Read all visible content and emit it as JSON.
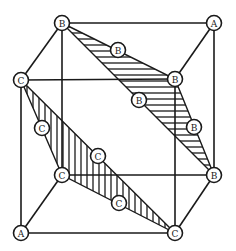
{
  "diagram": {
    "type": "crystal-lattice-cube",
    "colors": {
      "stroke": "#1a1a1a",
      "fill": "#ffffff"
    },
    "cube_vertices": [
      {
        "id": "v_top_back_left",
        "label": "B",
        "x": 62,
        "y": 23
      },
      {
        "id": "v_top_back_right",
        "label": "A",
        "x": 214,
        "y": 23
      },
      {
        "id": "v_top_front_left",
        "label": "C",
        "x": 21,
        "y": 80
      },
      {
        "id": "v_top_front_right",
        "label": "B",
        "x": 175,
        "y": 79
      },
      {
        "id": "v_bot_back_left",
        "label": "C",
        "x": 62,
        "y": 175
      },
      {
        "id": "v_bot_back_right",
        "label": "B",
        "x": 214,
        "y": 175
      },
      {
        "id": "v_bot_front_left",
        "label": "A",
        "x": 21,
        "y": 233
      },
      {
        "id": "v_bot_front_right",
        "label": "C",
        "x": 175,
        "y": 233
      }
    ],
    "edge_midpoints": [
      {
        "id": "m_b_upper",
        "label": "B",
        "x": 118,
        "y": 50
      },
      {
        "id": "m_b_diag",
        "label": "B",
        "x": 139,
        "y": 100
      },
      {
        "id": "m_b_right",
        "label": "B",
        "x": 194,
        "y": 127
      },
      {
        "id": "m_c_left",
        "label": "C",
        "x": 42,
        "y": 128
      },
      {
        "id": "m_c_diag",
        "label": "C",
        "x": 98,
        "y": 156
      },
      {
        "id": "m_c_lower",
        "label": "C",
        "x": 119,
        "y": 203
      }
    ],
    "hatched_planes": [
      {
        "name": "B-plane",
        "hatch": "horizontal",
        "vertices": [
          "v_top_back_left",
          "v_top_front_right",
          "v_bot_back_right"
        ]
      },
      {
        "name": "C-plane",
        "hatch": "vertical",
        "vertices": [
          "v_top_front_left",
          "v_bot_back_left",
          "v_bot_front_right"
        ]
      }
    ]
  }
}
